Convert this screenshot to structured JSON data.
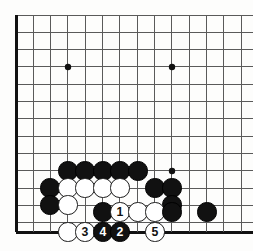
{
  "figure": {
    "type": "go-board-diagram",
    "board": {
      "origin_x": 16,
      "origin_y": 15,
      "spacing": 17.33,
      "cols": 14,
      "rows": 13,
      "bottom_edge_y": 232,
      "left_edge_x": 16,
      "line_color": "#5a5a5a",
      "edge_color": "#111111",
      "grid_line_width": 1,
      "edge_line_width": 3,
      "background_color": "#fdfdfc",
      "star_point_color": "#111111",
      "star_point_radius": 3.2,
      "star_points": [
        {
          "x": 68,
          "y": 67
        },
        {
          "x": 172,
          "y": 67
        },
        {
          "x": 172,
          "y": 171
        }
      ]
    },
    "stone_radius": 9.6,
    "colors": {
      "black_stone": "#111111",
      "white_stone": "#ffffff",
      "white_stone_border": "#1a1a1a",
      "black_label_text": "#ffffff",
      "white_label_text": "#111111"
    },
    "stones": [
      {
        "id": "b-r6-c3",
        "color": "black",
        "label": "",
        "x": 68,
        "y": 171
      },
      {
        "id": "b-r6-c4",
        "color": "black",
        "label": "",
        "x": 85,
        "y": 171
      },
      {
        "id": "b-r6-c5",
        "color": "black",
        "label": "",
        "x": 103,
        "y": 171
      },
      {
        "id": "b-r6-c6",
        "color": "black",
        "label": "",
        "x": 120,
        "y": 171
      },
      {
        "id": "b-r6-c7",
        "color": "black",
        "label": "",
        "x": 138,
        "y": 171
      },
      {
        "id": "b-r7-c2",
        "color": "black",
        "label": "",
        "x": 50,
        "y": 188
      },
      {
        "id": "w-r7-c3",
        "color": "white",
        "label": "",
        "x": 68,
        "y": 188
      },
      {
        "id": "w-r7-c4",
        "color": "white",
        "label": "",
        "x": 85,
        "y": 188
      },
      {
        "id": "w-r7-c5",
        "color": "white",
        "label": "",
        "x": 103,
        "y": 188
      },
      {
        "id": "w-r7-c6",
        "color": "white",
        "label": "",
        "x": 120,
        "y": 188
      },
      {
        "id": "b-r7-c8",
        "color": "black",
        "label": "",
        "x": 155,
        "y": 188
      },
      {
        "id": "b-r7-c9",
        "color": "black",
        "label": "",
        "x": 172,
        "y": 188
      },
      {
        "id": "b-r8-c2",
        "color": "black",
        "label": "",
        "x": 50,
        "y": 205
      },
      {
        "id": "w-r8-c3",
        "color": "white",
        "label": "",
        "x": 68,
        "y": 205
      },
      {
        "id": "b-r8-c9",
        "color": "black",
        "label": "",
        "x": 172,
        "y": 205
      },
      {
        "id": "b-r9-c5",
        "color": "black",
        "label": "",
        "x": 103,
        "y": 212
      },
      {
        "id": "w-move-1",
        "color": "white",
        "label": "1",
        "x": 120,
        "y": 212
      },
      {
        "id": "w-r9-c7",
        "color": "white",
        "label": "",
        "x": 138,
        "y": 212
      },
      {
        "id": "w-r9-c8",
        "color": "white",
        "label": "",
        "x": 155,
        "y": 212
      },
      {
        "id": "b-r9-c9",
        "color": "black",
        "label": "",
        "x": 172,
        "y": 212
      },
      {
        "id": "b-r9-c11",
        "color": "black",
        "label": "",
        "x": 207,
        "y": 212
      },
      {
        "id": "w-r10-c3",
        "color": "white",
        "label": "",
        "x": 68,
        "y": 232
      },
      {
        "id": "w-move-3",
        "color": "white",
        "label": "3",
        "x": 85,
        "y": 232
      },
      {
        "id": "b-move-4",
        "color": "black",
        "label": "4",
        "x": 103,
        "y": 232
      },
      {
        "id": "b-move-2",
        "color": "black",
        "label": "2",
        "x": 120,
        "y": 232
      },
      {
        "id": "w-move-5",
        "color": "white",
        "label": "5",
        "x": 155,
        "y": 232
      }
    ],
    "move_sequence": [
      {
        "number": "1",
        "color": "white"
      },
      {
        "number": "2",
        "color": "black"
      },
      {
        "number": "3",
        "color": "white"
      },
      {
        "number": "4",
        "color": "black"
      },
      {
        "number": "5",
        "color": "white"
      }
    ]
  }
}
